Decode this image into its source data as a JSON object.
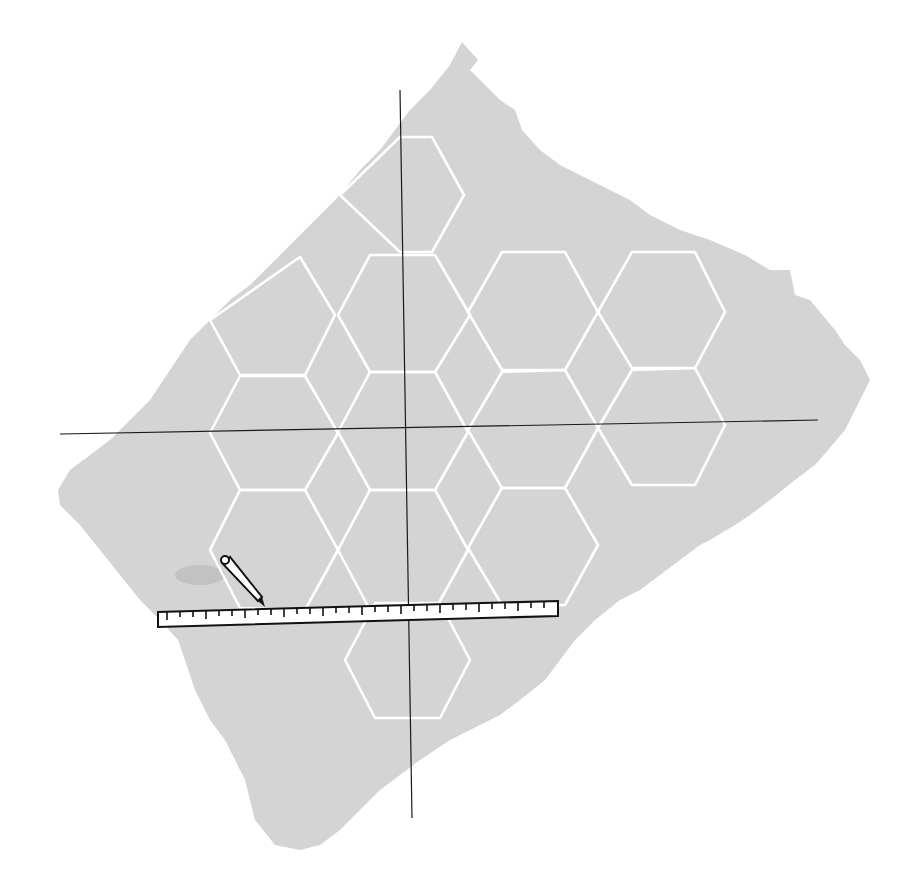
{
  "illustration": {
    "subject": "hexagonal grid on torn paper with coordinate axes, ruler and pencil",
    "colors": {
      "background": "#ffffff",
      "paper": "#d4d4d4",
      "hex_lines": "#ffffff",
      "axes": "#1a1a1a",
      "ruler_fill": "#ffffff",
      "ruler_outline": "#111111"
    },
    "ruler": {
      "tick_count": 30
    },
    "hexagon_count": 16
  }
}
